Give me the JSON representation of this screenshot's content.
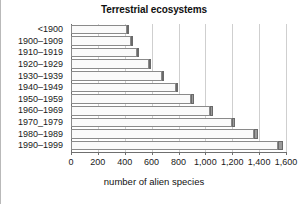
{
  "chart_data": {
    "type": "bar",
    "orientation": "horizontal",
    "title": "Terrestrial ecosystems",
    "xlabel": "number of alien species",
    "ylabel": "",
    "xlim": [
      0,
      1600
    ],
    "ylim": null,
    "grid": true,
    "legend": null,
    "xticks": [
      0,
      200,
      400,
      600,
      800,
      1000,
      1200,
      1400,
      1600
    ],
    "xtick_labels": [
      "0",
      "200",
      "400",
      "600",
      "800",
      "1,000",
      "1,200",
      "1,400",
      "1,600"
    ],
    "categories": [
      "<1900",
      "1900–1909",
      "1910–1919",
      "1920–1929",
      "1930–1939",
      "1940–1949",
      "1950–1959",
      "1960–1969",
      "1970_1979",
      "1980–1989",
      "1990–1999"
    ],
    "values": [
      430,
      460,
      505,
      595,
      690,
      795,
      915,
      1055,
      1220,
      1390,
      1575
    ],
    "increments": [
      430,
      30,
      45,
      90,
      95,
      105,
      120,
      140,
      165,
      170,
      185
    ],
    "series": [
      {
        "name": "cumulative number of alien species",
        "values": [
          430,
          460,
          505,
          595,
          690,
          795,
          915,
          1055,
          1220,
          1390,
          1575
        ]
      }
    ],
    "colors": {
      "bar_fill": "#fafafa",
      "bar_border": "#8a8a8a",
      "bar_cap_fill": "#9b9b9b",
      "bar_cap_border": "#6a6a6a",
      "gridline": "#cfcfcf",
      "axis": "#6f6f6f",
      "text": "#1a1a1a",
      "background": "#ffffff"
    }
  }
}
